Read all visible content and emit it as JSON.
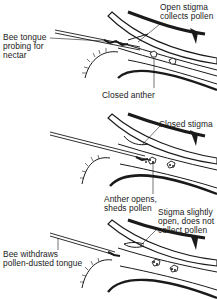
{
  "figure": {
    "colors": {
      "ink": "#1a1a1a",
      "paper": "#ffffff",
      "shade": "#cfcfcf"
    },
    "panels": [
      {
        "id": "stage-1",
        "labels": {
          "stigma": "Open stigma\ncollects pollen",
          "tongue": "Bee tongue\nprobing for\nnectar",
          "anther": "Closed anther"
        }
      },
      {
        "id": "stage-2",
        "labels": {
          "stigma": "Closed stigma",
          "anther": "Anther opens,\nsheds pollen"
        }
      },
      {
        "id": "stage-3",
        "labels": {
          "stigma": "Stigma slightly\nopen, does not\ncollect pollen",
          "tongue": "Bee withdraws\npollen-dusted tongue"
        }
      }
    ]
  }
}
